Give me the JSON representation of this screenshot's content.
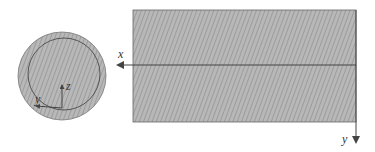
{
  "diagram": {
    "title": "",
    "colors": {
      "fill": "#b8b8b8",
      "hatch": "#8a8a8a",
      "stroke": "#555555",
      "axis": "#444444"
    },
    "cross_section": {
      "shape": "circle",
      "labels": {
        "z": "z",
        "y": "y"
      }
    },
    "side_view": {
      "shape": "rectangle",
      "labels": {
        "x": "x",
        "y": "y"
      }
    }
  }
}
